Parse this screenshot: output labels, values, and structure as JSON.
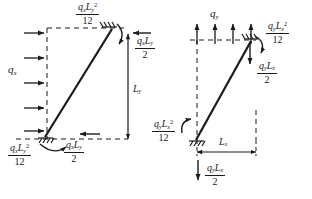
{
  "figure": {
    "ink_color": "#1a1a1a",
    "background": "#ffffff"
  },
  "left_diagram": {
    "name": "horizontal-load-case",
    "load_label": "q",
    "load_label_sub": "x",
    "load_direction": "rightward",
    "load_arrow_count": 5,
    "dimension": {
      "label": "L",
      "sub": "y",
      "orientation": "vertical"
    },
    "top_moment": {
      "num_q": "q",
      "num_q_sub": "x",
      "num_L": "L",
      "num_L_sub": "y",
      "num_exp": "2",
      "den": "12"
    },
    "bottom_moment": {
      "num_q": "q",
      "num_q_sub": "x",
      "num_L": "L",
      "num_L_sub": "y",
      "num_exp": "2",
      "den": "12"
    },
    "top_reaction": {
      "num_q": "q",
      "num_q_sub": "x",
      "num_L": "L",
      "num_L_sub": "y",
      "den": "2",
      "arrow": "leftward"
    },
    "bottom_reaction": {
      "num_q": "q",
      "num_q_sub": "x",
      "num_L": "L",
      "num_L_sub": "y",
      "den": "2",
      "arrow": "leftward"
    }
  },
  "right_diagram": {
    "name": "vertical-load-case",
    "load_label": "q",
    "load_label_sub": "y",
    "load_direction": "upward",
    "load_arrow_count": 4,
    "dimension": {
      "label": "L",
      "sub": "x",
      "orientation": "horizontal"
    },
    "top_moment": {
      "num_q": "q",
      "num_q_sub": "y",
      "num_L": "L",
      "num_L_sub": "x",
      "num_exp": "2",
      "den": "12"
    },
    "bottom_moment": {
      "num_q": "q",
      "num_q_sub": "y",
      "num_L": "L",
      "num_L_sub": "x",
      "num_exp": "2",
      "den": "12"
    },
    "top_reaction": {
      "num_q": "q",
      "num_q_sub": "y",
      "num_L": "L",
      "num_L_sub": "x",
      "den": "2",
      "arrow": "downward"
    },
    "bottom_reaction": {
      "num_q": "q",
      "num_q_sub": "y",
      "num_L": "L",
      "num_L_sub": "x",
      "den": "2",
      "arrow": "downward"
    }
  }
}
